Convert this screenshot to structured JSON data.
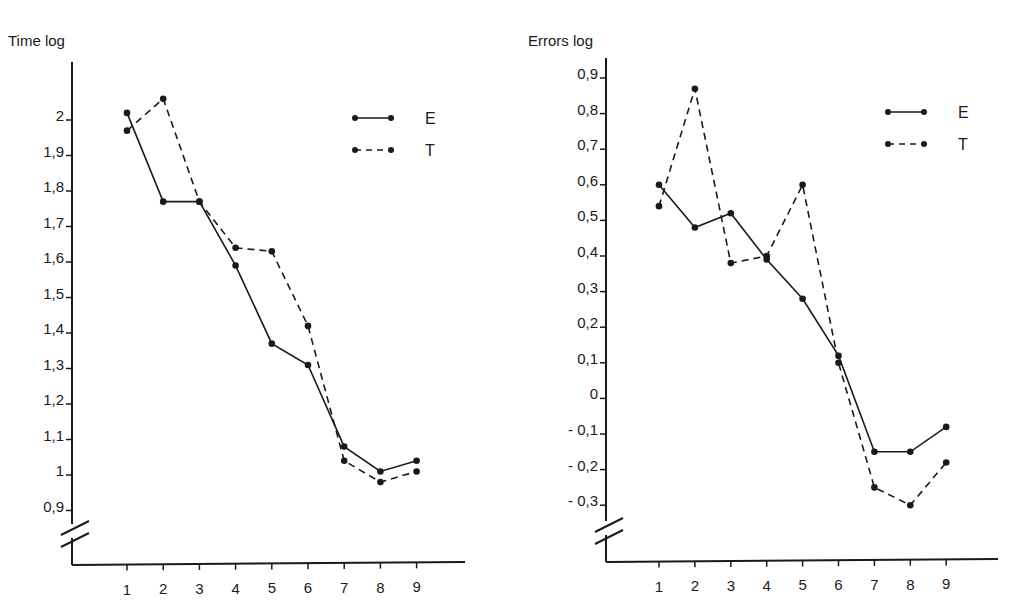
{
  "chart_data": [
    {
      "type": "line",
      "title": "",
      "ylabel": "Time log",
      "xlabel": "",
      "categories": [
        1,
        2,
        3,
        4,
        5,
        6,
        7,
        8,
        9
      ],
      "yticks": [
        "0,9",
        "1",
        "1,1",
        "1,2",
        "1,3",
        "1,4",
        "1,5",
        "1,6",
        "1,7",
        "1,8",
        "1,9",
        "2"
      ],
      "ylim": [
        0.9,
        2.1
      ],
      "axis_break": true,
      "grid": false,
      "legend_position": "upper right",
      "series": [
        {
          "name": "E",
          "style": "solid",
          "values": [
            2.02,
            1.77,
            1.77,
            1.59,
            1.37,
            1.31,
            1.08,
            1.01,
            1.04
          ]
        },
        {
          "name": "T",
          "style": "dashed",
          "values": [
            1.97,
            2.06,
            1.77,
            1.64,
            1.63,
            1.42,
            1.04,
            0.98,
            1.01
          ]
        }
      ]
    },
    {
      "type": "line",
      "title": "",
      "ylabel": "Errors log",
      "xlabel": "",
      "categories": [
        1,
        2,
        3,
        4,
        5,
        6,
        7,
        8,
        9
      ],
      "yticks": [
        "- 0,3",
        "- 0,2",
        "- 0,1",
        "0",
        "0,1",
        "0,2",
        "0,3",
        "0,4",
        "0,5",
        "0,6",
        "0,7",
        "0,8",
        "0,9"
      ],
      "ylim": [
        -0.3,
        0.9
      ],
      "axis_break": true,
      "grid": false,
      "legend_position": "upper right",
      "series": [
        {
          "name": "E",
          "style": "solid",
          "values": [
            0.6,
            0.48,
            0.52,
            0.39,
            0.28,
            0.12,
            -0.15,
            -0.15,
            -0.08
          ]
        },
        {
          "name": "T",
          "style": "dashed",
          "values": [
            0.54,
            0.87,
            0.38,
            0.4,
            0.6,
            0.1,
            -0.25,
            -0.3,
            -0.18
          ]
        }
      ]
    }
  ],
  "left": {
    "ylabel": "Time log",
    "legend": [
      "E",
      "T"
    ]
  },
  "right": {
    "ylabel": "Errors log",
    "legend": [
      "E",
      "T"
    ]
  }
}
